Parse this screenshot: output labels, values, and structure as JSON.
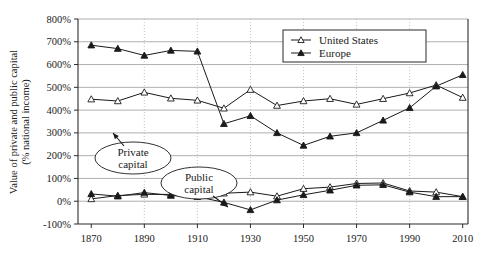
{
  "chart_data": {
    "type": "line",
    "title": "",
    "xlabel": "",
    "ylabel": "Value of private and public capital (% national income)",
    "ylabel_line1": "Value of private and public capital",
    "ylabel_line2": "(% national income)",
    "x": [
      1870,
      1880,
      1890,
      1900,
      1910,
      1920,
      1930,
      1940,
      1950,
      1960,
      1970,
      1980,
      1990,
      2000,
      2010
    ],
    "xlim": [
      1865,
      2012
    ],
    "ylim": [
      -100,
      800
    ],
    "xticks": [
      1870,
      1890,
      1910,
      1930,
      1950,
      1970,
      1990,
      2010
    ],
    "xtick_labels": [
      "1870",
      "1890",
      "1910",
      "1930",
      "1950",
      "1970",
      "1990",
      "2010"
    ],
    "yticks": [
      -100,
      0,
      100,
      200,
      300,
      400,
      500,
      600,
      700,
      800
    ],
    "ytick_labels": [
      "-100%",
      "0%",
      "100%",
      "200%",
      "300%",
      "400%",
      "500%",
      "600%",
      "700%",
      "800%"
    ],
    "grid": true,
    "grid_horizontal": true,
    "grid_vertical_dotted_at": [
      1890,
      1910,
      1930,
      1950,
      1970,
      1990
    ],
    "legend_position": "top-right",
    "series": [
      {
        "name": "United States",
        "marker": "open-triangle",
        "capital_type": "private",
        "values": [
          448,
          440,
          478,
          452,
          443,
          408,
          490,
          420,
          440,
          450,
          425,
          450,
          475,
          510,
          455
        ]
      },
      {
        "name": "Europe",
        "marker": "filled-triangle",
        "capital_type": "private",
        "values": [
          685,
          670,
          640,
          662,
          658,
          340,
          375,
          300,
          245,
          285,
          300,
          355,
          410,
          505,
          555
        ]
      },
      {
        "name": "United States",
        "marker": "open-triangle",
        "capital_type": "public",
        "values": [
          10,
          25,
          30,
          30,
          32,
          35,
          40,
          22,
          55,
          62,
          78,
          80,
          45,
          40,
          20
        ]
      },
      {
        "name": "Europe",
        "marker": "filled-triangle",
        "capital_type": "public",
        "values": [
          32,
          22,
          38,
          25,
          20,
          -5,
          -38,
          5,
          28,
          48,
          70,
          72,
          40,
          20,
          20
        ]
      }
    ],
    "legend": [
      {
        "label": "United States",
        "marker": "open-triangle"
      },
      {
        "label": "Europe",
        "marker": "filled-triangle"
      }
    ],
    "annotations": [
      {
        "label": "Private capital",
        "line1": "Private",
        "line2": "capital",
        "target_x": 1890,
        "target_y": 455
      },
      {
        "label": "Public capital",
        "line1": "Public",
        "line2": "capital",
        "target_x": 1960,
        "target_y": 62
      }
    ]
  }
}
